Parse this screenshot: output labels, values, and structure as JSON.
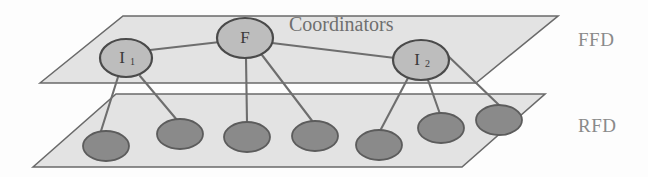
{
  "figure": {
    "name": "two-tier-network-topology",
    "background_color": "#fdfdfd"
  },
  "planes": [
    {
      "id": "ffd-plane",
      "label": "FFD",
      "label_x": 578,
      "label_y": 42,
      "points": "40,83 123,16 558,16 476,83",
      "fill": "#e3e3e3",
      "stroke": "#6a6a6a"
    },
    {
      "id": "rfd-plane",
      "label": "RFD",
      "label_x": 578,
      "label_y": 128,
      "points": "33,167 116,94 545,94 462,167",
      "fill": "#e3e3e3",
      "stroke": "#6a6a6a"
    }
  ],
  "annotations": [
    {
      "id": "coordinators-label",
      "text": "Coordinators",
      "x": 289,
      "y": 26,
      "color": "#6f6f6f"
    }
  ],
  "coordinator_nodes": [
    {
      "id": "node-i1",
      "label": "I",
      "subscript": "1",
      "cx": 126,
      "cy": 58,
      "rx": 26,
      "ry": 19
    },
    {
      "id": "node-f",
      "label": "F",
      "subscript": "",
      "cx": 245,
      "cy": 38,
      "rx": 28,
      "ry": 20
    },
    {
      "id": "node-i2",
      "label": "I",
      "subscript": "2",
      "cx": 421,
      "cy": 60,
      "rx": 28,
      "ry": 20
    }
  ],
  "device_nodes": [
    {
      "id": "device-1",
      "cx": 106,
      "cy": 146,
      "rx": 23,
      "ry": 15
    },
    {
      "id": "device-2",
      "cx": 180,
      "cy": 134,
      "rx": 23,
      "ry": 15
    },
    {
      "id": "device-3",
      "cx": 247,
      "cy": 137,
      "rx": 23,
      "ry": 15
    },
    {
      "id": "device-4",
      "cx": 315,
      "cy": 136,
      "rx": 23,
      "ry": 15
    },
    {
      "id": "device-5",
      "cx": 379,
      "cy": 145,
      "rx": 23,
      "ry": 15
    },
    {
      "id": "device-6",
      "cx": 441,
      "cy": 128,
      "rx": 23,
      "ry": 15
    },
    {
      "id": "device-7",
      "cx": 499,
      "cy": 120,
      "rx": 23,
      "ry": 15
    }
  ],
  "edges": [
    {
      "id": "edge-i1-f",
      "from": "node-i1",
      "to": "node-f",
      "x1": 150,
      "y1": 50,
      "x2": 220,
      "y2": 42
    },
    {
      "id": "edge-f-i2",
      "from": "node-f",
      "to": "node-i2",
      "x1": 272,
      "y1": 43,
      "x2": 395,
      "y2": 58
    },
    {
      "id": "edge-i1-d1",
      "from": "node-i1",
      "to": "device-1",
      "x1": 118,
      "y1": 77,
      "x2": 101,
      "y2": 131
    },
    {
      "id": "edge-i1-d2",
      "from": "node-i1",
      "to": "device-2",
      "x1": 140,
      "y1": 76,
      "x2": 177,
      "y2": 120
    },
    {
      "id": "edge-f-d3",
      "from": "node-f",
      "to": "device-3",
      "x1": 246,
      "y1": 58,
      "x2": 247,
      "y2": 122
    },
    {
      "id": "edge-f-d4",
      "from": "node-f",
      "to": "device-4",
      "x1": 262,
      "y1": 55,
      "x2": 313,
      "y2": 122
    },
    {
      "id": "edge-i2-d5",
      "from": "node-i2",
      "to": "device-5",
      "x1": 408,
      "y1": 78,
      "x2": 380,
      "y2": 131
    },
    {
      "id": "edge-i2-d6",
      "from": "node-i2",
      "to": "device-6",
      "x1": 428,
      "y1": 80,
      "x2": 440,
      "y2": 114
    },
    {
      "id": "edge-i2-d7",
      "from": "node-i2",
      "to": "device-7",
      "x1": 445,
      "y1": 53,
      "x2": 500,
      "y2": 106
    }
  ],
  "colors": {
    "plane_fill": "#e3e3e3",
    "plane_stroke": "#6a6a6a",
    "coordinator_fill": "#bdbdbd",
    "coordinator_stroke": "#4a4a4a",
    "device_fill": "#8a8a8a",
    "device_stroke": "#5c5c5c",
    "edge_stroke": "#6e6e6e",
    "label_color": "#8a8a8a",
    "annotation_color": "#6f6f6f"
  }
}
